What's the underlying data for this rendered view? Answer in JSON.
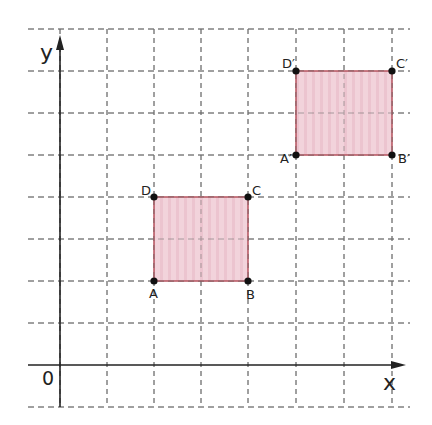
{
  "axes": {
    "x_label": "x",
    "y_label": "y",
    "origin_label": "0"
  },
  "grid": {
    "x_lines": [
      60,
      107,
      154,
      201,
      248,
      296,
      344,
      392
    ],
    "y_lines": [
      29,
      71,
      113,
      155,
      197,
      239,
      281,
      323,
      407
    ],
    "x_extent": [
      28,
      410
    ],
    "y_extent": [
      29,
      407
    ],
    "color": "#6b6b6b"
  },
  "shapes": {
    "original": {
      "name": "ABCD",
      "points": {
        "A": {
          "label": "A",
          "px": 154,
          "py": 281,
          "grid": [
            2,
            2
          ]
        },
        "B": {
          "label": "B",
          "px": 248,
          "py": 281,
          "grid": [
            4,
            2
          ]
        },
        "C": {
          "label": "C",
          "px": 248,
          "py": 197,
          "grid": [
            4,
            4
          ]
        },
        "D": {
          "label": "D",
          "px": 154,
          "py": 197,
          "grid": [
            2,
            4
          ]
        }
      }
    },
    "image": {
      "name": "A'B'C'D'",
      "points": {
        "A": {
          "label": "A′",
          "px": 296,
          "py": 155,
          "grid": [
            5,
            5
          ]
        },
        "B": {
          "label": "B′",
          "px": 392,
          "py": 155,
          "grid": [
            7,
            5
          ]
        },
        "C": {
          "label": "C′",
          "px": 392,
          "py": 71,
          "grid": [
            7,
            7
          ]
        },
        "D": {
          "label": "D′",
          "px": 296,
          "py": 71,
          "grid": [
            5,
            7
          ]
        }
      }
    }
  },
  "colors": {
    "fill": "#f0cdd6",
    "stroke": "#b5525e",
    "axis": "#222222",
    "point": "#111111"
  }
}
